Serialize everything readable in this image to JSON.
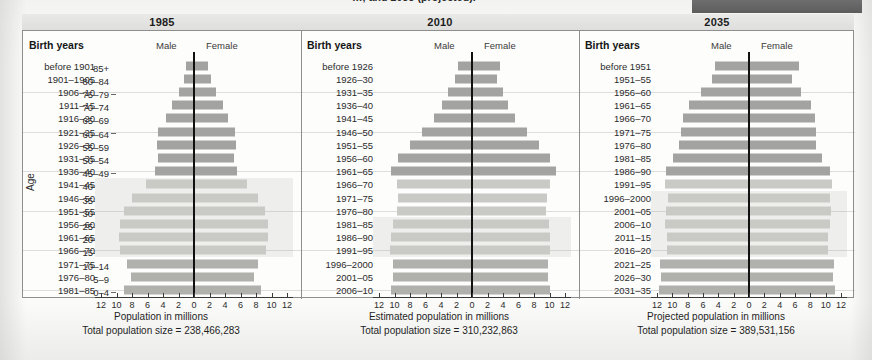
{
  "caption": {
    "fragment": "…, and 2035 (projected)."
  },
  "axis": {
    "age_label": "Age",
    "age_groups": [
      "85+",
      "80–84",
      "75–79",
      "70–74",
      "65–69",
      "60–64",
      "55–59",
      "50–54",
      "45–49",
      "40–44",
      "35–39",
      "30–34",
      "25–29",
      "20–24",
      "15–19",
      "10–14",
      "5–9",
      "0–4"
    ],
    "tick_values": [
      12,
      10,
      8,
      6,
      4,
      2,
      0,
      2,
      4,
      6,
      8,
      10,
      12
    ],
    "max": 12
  },
  "legend": {
    "male": "Male",
    "female": "Female",
    "birth_years": "Birth years"
  },
  "chart_data": {
    "type": "bar",
    "xlabel": "Population in millions",
    "ylabel": "Age",
    "xlim": [
      -12,
      12
    ],
    "grid": false,
    "legend_position": "top-center",
    "categories": [
      "85+",
      "80–84",
      "75–79",
      "70–74",
      "65–69",
      "60–64",
      "55–59",
      "50–54",
      "45–49",
      "40–44",
      "35–39",
      "30–34",
      "25–29",
      "20–24",
      "15–19",
      "10–14",
      "5–9",
      "0–4"
    ],
    "panels": [
      {
        "year": "1985",
        "axis_title": "Population in millions",
        "total_label": "Total population size = 238,466,283",
        "total_population": 238466283,
        "highlight_rows": [
          9,
          10,
          11,
          12,
          13,
          14
        ],
        "rows": [
          {
            "birth_years": "before 1901",
            "age": "85+",
            "male": 1.0,
            "female": 1.8,
            "shade": "old"
          },
          {
            "birth_years": "1901–1905",
            "age": "80–84",
            "male": 1.3,
            "female": 2.2,
            "shade": "old"
          },
          {
            "birth_years": "1906–10",
            "age": "75–79",
            "male": 2.0,
            "female": 2.9,
            "shade": "old"
          },
          {
            "birth_years": "1911–15",
            "age": "70–74",
            "male": 2.8,
            "female": 3.8,
            "shade": "old"
          },
          {
            "birth_years": "1916–20",
            "age": "65–69",
            "male": 3.6,
            "female": 4.4,
            "shade": "old"
          },
          {
            "birth_years": "1921–25",
            "age": "60–64",
            "male": 4.6,
            "female": 5.3,
            "shade": "old"
          },
          {
            "birth_years": "1926–30",
            "age": "55–59",
            "male": 4.8,
            "female": 5.4,
            "shade": "old"
          },
          {
            "birth_years": "1931–35",
            "age": "50–54",
            "male": 4.7,
            "female": 5.1,
            "shade": "old"
          },
          {
            "birth_years": "1936–40",
            "age": "45–49",
            "male": 5.0,
            "female": 5.5,
            "shade": "old"
          },
          {
            "birth_years": "1941–45",
            "age": "40–44",
            "male": 6.2,
            "female": 6.8,
            "shade": "boom"
          },
          {
            "birth_years": "1946–50",
            "age": "35–39",
            "male": 8.0,
            "female": 8.3,
            "shade": "boom"
          },
          {
            "birth_years": "1951–55",
            "age": "30–34",
            "male": 9.0,
            "female": 9.2,
            "shade": "boom"
          },
          {
            "birth_years": "1956–60",
            "age": "25–29",
            "male": 9.5,
            "female": 9.5,
            "shade": "boom"
          },
          {
            "birth_years": "1961–65",
            "age": "20–24",
            "male": 9.7,
            "female": 9.6,
            "shade": "boom"
          },
          {
            "birth_years": "1966–70",
            "age": "15–19",
            "male": 9.5,
            "female": 9.3,
            "shade": "boom"
          },
          {
            "birth_years": "1971–75",
            "age": "10–14",
            "male": 8.6,
            "female": 8.3,
            "shade": "new"
          },
          {
            "birth_years": "1976–80",
            "age": "5–9",
            "male": 8.1,
            "female": 7.7,
            "shade": "new"
          },
          {
            "birth_years": "1981–85",
            "age": "0–4",
            "male": 9.0,
            "female": 8.6,
            "shade": "new"
          }
        ]
      },
      {
        "year": "2010",
        "axis_title": "Estimated population in millions",
        "total_label": "Total population size = 310,232,863",
        "total_population": 310232863,
        "highlight_rows": [
          12,
          13,
          14
        ],
        "rows": [
          {
            "birth_years": "before 1926",
            "age": "85+",
            "male": 1.8,
            "female": 3.6,
            "shade": "old"
          },
          {
            "birth_years": "1926–30",
            "age": "80–84",
            "male": 2.2,
            "female": 3.2,
            "shade": "old"
          },
          {
            "birth_years": "1931–35",
            "age": "75–79",
            "male": 3.1,
            "female": 4.0,
            "shade": "old"
          },
          {
            "birth_years": "1936–40",
            "age": "70–74",
            "male": 3.9,
            "female": 4.6,
            "shade": "old"
          },
          {
            "birth_years": "1941–45",
            "age": "65–69",
            "male": 4.9,
            "female": 5.6,
            "shade": "old"
          },
          {
            "birth_years": "1946–50",
            "age": "60–64",
            "male": 6.5,
            "female": 7.1,
            "shade": "old"
          },
          {
            "birth_years": "1951–55",
            "age": "55–59",
            "male": 8.0,
            "female": 8.6,
            "shade": "old"
          },
          {
            "birth_years": "1956–60",
            "age": "50–54",
            "male": 9.6,
            "female": 10.1,
            "shade": "old"
          },
          {
            "birth_years": "1961–65",
            "age": "45–49",
            "male": 10.5,
            "female": 10.9,
            "shade": "old"
          },
          {
            "birth_years": "1966–70",
            "age": "40–44",
            "male": 9.7,
            "female": 10.0,
            "shade": "boom"
          },
          {
            "birth_years": "1971–75",
            "age": "35–39",
            "male": 9.6,
            "female": 9.7,
            "shade": "boom"
          },
          {
            "birth_years": "1976–80",
            "age": "30–34",
            "male": 9.7,
            "female": 9.6,
            "shade": "boom"
          },
          {
            "birth_years": "1981–85",
            "age": "25–29",
            "male": 10.2,
            "female": 9.9,
            "shade": "boom"
          },
          {
            "birth_years": "1986–90",
            "age": "20–24",
            "male": 10.5,
            "female": 10.1,
            "shade": "boom"
          },
          {
            "birth_years": "1991–95",
            "age": "15–19",
            "male": 10.6,
            "female": 10.1,
            "shade": "boom"
          },
          {
            "birth_years": "1996–2000",
            "age": "10–14",
            "male": 10.2,
            "female": 9.8,
            "shade": "new"
          },
          {
            "birth_years": "2001–05",
            "age": "5–9",
            "male": 10.2,
            "female": 9.8,
            "shade": "new"
          },
          {
            "birth_years": "2006–10",
            "age": "0–4",
            "male": 10.4,
            "female": 10.0,
            "shade": "new"
          }
        ]
      },
      {
        "year": "2035",
        "axis_title": "Projected population in millions",
        "total_label": "Total population size = 389,531,156",
        "total_population": 389531156,
        "highlight_rows": [
          10,
          11,
          12,
          13,
          14
        ],
        "rows": [
          {
            "birth_years": "before 1951",
            "age": "85+",
            "male": 4.4,
            "female": 6.5,
            "shade": "old"
          },
          {
            "birth_years": "1951–55",
            "age": "80–84",
            "male": 4.8,
            "female": 5.6,
            "shade": "old"
          },
          {
            "birth_years": "1956–60",
            "age": "75–79",
            "male": 6.3,
            "female": 6.8,
            "shade": "old"
          },
          {
            "birth_years": "1961–65",
            "age": "70–74",
            "male": 7.8,
            "female": 8.1,
            "shade": "old"
          },
          {
            "birth_years": "1966–70",
            "age": "65–69",
            "male": 8.6,
            "female": 8.6,
            "shade": "old"
          },
          {
            "birth_years": "1971–75",
            "age": "60–64",
            "male": 8.9,
            "female": 8.7,
            "shade": "old"
          },
          {
            "birth_years": "1976–80",
            "age": "55–59",
            "male": 9.1,
            "female": 8.7,
            "shade": "old"
          },
          {
            "birth_years": "1981–85",
            "age": "50–54",
            "male": 9.9,
            "female": 9.5,
            "shade": "old"
          },
          {
            "birth_years": "1986–90",
            "age": "45–49",
            "male": 10.8,
            "female": 10.6,
            "shade": "old"
          },
          {
            "birth_years": "1991–95",
            "age": "40–44",
            "male": 10.9,
            "female": 10.8,
            "shade": "boom"
          },
          {
            "birth_years": "1996–2000",
            "age": "35–39",
            "male": 10.6,
            "female": 10.6,
            "shade": "boom"
          },
          {
            "birth_years": "2001–05",
            "age": "30–34",
            "male": 10.8,
            "female": 10.7,
            "shade": "boom"
          },
          {
            "birth_years": "2006–10",
            "age": "25–29",
            "male": 10.9,
            "female": 10.5,
            "shade": "boom"
          },
          {
            "birth_years": "2011–15",
            "age": "20–24",
            "male": 10.7,
            "female": 10.3,
            "shade": "boom"
          },
          {
            "birth_years": "2016–20",
            "age": "15–19",
            "male": 10.7,
            "female": 10.3,
            "shade": "boom"
          },
          {
            "birth_years": "2021–25",
            "age": "10–14",
            "male": 11.6,
            "female": 11.1,
            "shade": "new"
          },
          {
            "birth_years": "2026–30",
            "age": "5–9",
            "male": 11.5,
            "female": 11.0,
            "shade": "new"
          },
          {
            "birth_years": "2031–35",
            "age": "0–4",
            "male": 11.7,
            "female": 11.2,
            "shade": "new"
          }
        ]
      }
    ]
  }
}
